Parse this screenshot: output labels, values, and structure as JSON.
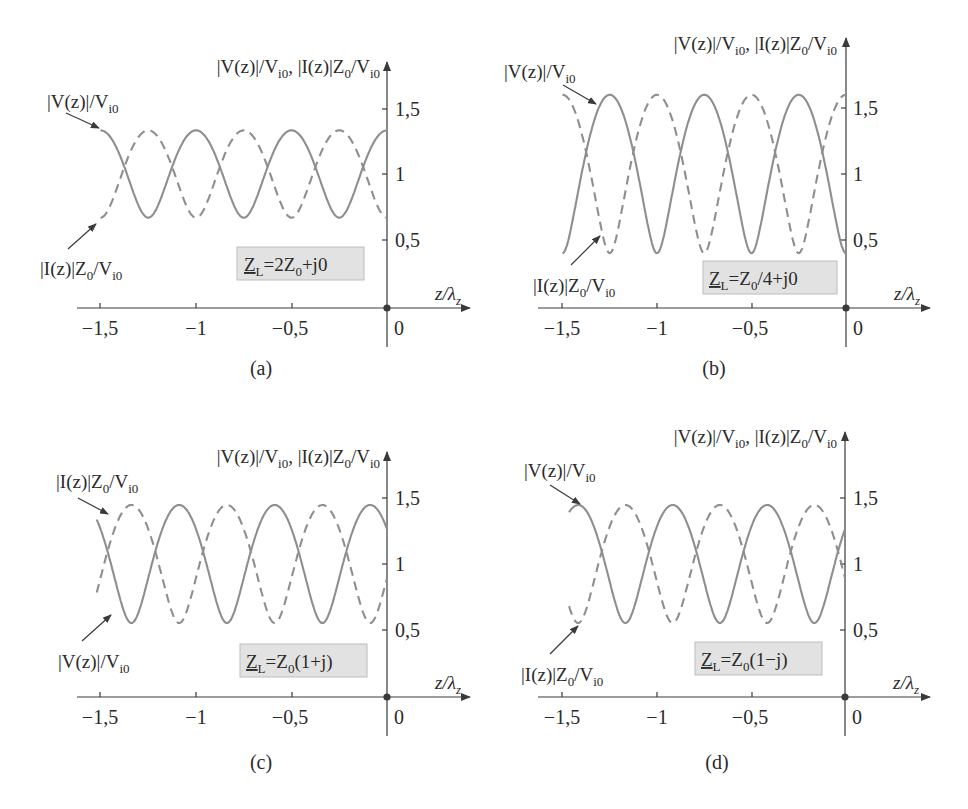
{
  "figure": {
    "y_axis_label": {
      "v": "|V(z)|/V",
      "v_sub": "i0",
      "sep": ", ",
      "i": "|I(z)|Z",
      "i_sub0": "0",
      "i_tail": "/V",
      "i_sub": "i0"
    },
    "x_axis_label": {
      "main": "z/λ",
      "sub": "z"
    },
    "x_ticks": [
      "−1,5",
      "−1",
      "−0,5",
      "0"
    ],
    "y_ticks": [
      "1,5",
      "1",
      "0,5"
    ],
    "legend_v": {
      "main": "|V(z)|/V",
      "sub": "i0"
    },
    "legend_i": {
      "main": "|I(z)|Z",
      "sub0": "0",
      "tail": "/V",
      "sub": "i0"
    },
    "colors": {
      "curve": "#8e8e8e",
      "axis": "#3a3a3a",
      "box_fill": "#e2e2e2",
      "box_border": "#bdbdbd"
    }
  },
  "panels": [
    {
      "id": "a",
      "caption": "(a)",
      "load": {
        "z": "Z",
        "sub": "L",
        "expr": "=2Z",
        "expr_sub": "0",
        "tail": "+j0"
      }
    },
    {
      "id": "b",
      "caption": "(b)",
      "load": {
        "z": "Z",
        "sub": "L",
        "expr": "=Z",
        "expr_sub": "0",
        "tail": "/4+j0"
      }
    },
    {
      "id": "c",
      "caption": "(c)",
      "load": {
        "z": "Z",
        "sub": "L",
        "expr": "=Z",
        "expr_sub": "0",
        "tail": "(1+j)"
      }
    },
    {
      "id": "d",
      "caption": "(d)",
      "load": {
        "z": "Z",
        "sub": "L",
        "expr": "=Z",
        "expr_sub": "0",
        "tail": "(1−j)"
      }
    }
  ],
  "chart_data": [
    {
      "type": "line",
      "panel": "(a)",
      "title": "Z_L = 2Z_0 + j0",
      "xlabel": "z/λ_z",
      "ylabel": "|V(z)|/V_i0, |I(z)|Z_0/V_i0",
      "xlim": [
        -1.5,
        0
      ],
      "x_ticks": [
        -1.5,
        -1,
        -0.5,
        0
      ],
      "y_ticks": [
        0.5,
        1,
        1.5
      ],
      "reflection_coefficient": {
        "re": 0.3333,
        "im": 0
      },
      "series": [
        {
          "name": "|V(z)|/V_i0",
          "style": "solid",
          "max": 1.333,
          "min": 0.667,
          "maxima_z": [
            -1.5,
            -1.0,
            -0.5,
            0.0
          ],
          "minima_z": [
            -1.25,
            -0.75,
            -0.25
          ]
        },
        {
          "name": "|I(z)|Z_0/V_i0",
          "style": "dashed",
          "max": 1.333,
          "min": 0.667,
          "maxima_z": [
            -1.25,
            -0.75,
            -0.25
          ],
          "minima_z": [
            -1.5,
            -1.0,
            -0.5,
            0.0
          ]
        }
      ],
      "x_start": -1.5
    },
    {
      "type": "line",
      "panel": "(b)",
      "title": "Z_L = Z_0/4 + j0",
      "xlabel": "z/λ_z",
      "ylabel": "|V(z)|/V_i0, |I(z)|Z_0/V_i0",
      "xlim": [
        -1.5,
        0
      ],
      "x_ticks": [
        -1.5,
        -1,
        -0.5,
        0
      ],
      "y_ticks": [
        0.5,
        1,
        1.5
      ],
      "reflection_coefficient": {
        "re": -0.6,
        "im": 0
      },
      "series": [
        {
          "name": "|V(z)|/V_i0",
          "style": "solid",
          "max": 1.6,
          "min": 0.4,
          "maxima_z": [
            -1.25,
            -0.75,
            -0.25
          ],
          "minima_z": [
            -1.5,
            -1.0,
            -0.5,
            0.0
          ]
        },
        {
          "name": "|I(z)|Z_0/V_i0",
          "style": "dashed",
          "max": 1.6,
          "min": 0.4,
          "maxima_z": [
            -1.5,
            -1.0,
            -0.5,
            0.0
          ],
          "minima_z": [
            -1.25,
            -0.75,
            -0.25
          ]
        }
      ],
      "x_start": -1.5
    },
    {
      "type": "line",
      "panel": "(c)",
      "title": "Z_L = Z_0(1+j)",
      "xlabel": "z/λ_z",
      "ylabel": "|V(z)|/V_i0, |I(z)|Z_0/V_i0",
      "xlim": [
        -1.5,
        0
      ],
      "x_ticks": [
        -1.5,
        -1,
        -0.5,
        0
      ],
      "y_ticks": [
        0.5,
        1,
        1.5
      ],
      "reflection_coefficient": {
        "re": 0.2,
        "im": 0.4
      },
      "series": [
        {
          "name": "|V(z)|/V_i0",
          "style": "solid",
          "max": 1.447,
          "min": 0.553,
          "maxima_z": [
            -1.088,
            -0.588,
            -0.088
          ],
          "minima_z": [
            -1.338,
            -0.838,
            -0.338
          ]
        },
        {
          "name": "|I(z)|Z_0/V_i0",
          "style": "dashed",
          "max": 1.447,
          "min": 0.553,
          "maxima_z": [
            -1.338,
            -0.838,
            -0.338
          ],
          "minima_z": [
            -1.088,
            -0.588,
            -0.088
          ]
        }
      ],
      "x_start": -1.52
    },
    {
      "type": "line",
      "panel": "(d)",
      "title": "Z_L = Z_0(1−j)",
      "xlabel": "z/λ_z",
      "ylabel": "|V(z)|/V_i0, |I(z)|Z_0/V_i0",
      "xlim": [
        -1.5,
        0
      ],
      "x_ticks": [
        -1.5,
        -1,
        -0.5,
        0
      ],
      "y_ticks": [
        0.5,
        1,
        1.5
      ],
      "reflection_coefficient": {
        "re": 0.2,
        "im": -0.4
      },
      "series": [
        {
          "name": "|V(z)|/V_i0",
          "style": "solid",
          "max": 1.447,
          "min": 0.553,
          "maxima_z": [
            -1.412,
            -0.912,
            -0.412
          ],
          "minima_z": [
            -1.162,
            -0.662,
            -0.162
          ]
        },
        {
          "name": "|I(z)|Z_0/V_i0",
          "style": "dashed",
          "max": 1.447,
          "min": 0.553,
          "maxima_z": [
            -1.162,
            -0.662,
            -0.162
          ],
          "minima_z": [
            -1.412,
            -0.912,
            -0.412
          ]
        }
      ],
      "x_start": -1.46
    }
  ]
}
